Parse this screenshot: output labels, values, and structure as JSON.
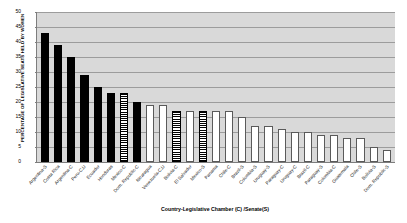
{
  "chart_data": {
    "type": "bar",
    "title": "",
    "xlabel": "Country-Legislative Chamber (C) /Senate(S)",
    "ylabel": "PERCENTAGE OF LEGISLATIVE SEATS HELD BY WOMEN",
    "ylim": [
      0,
      50
    ],
    "ytick_step": 5,
    "yticks": [
      "50",
      "45",
      "40",
      "35",
      "30",
      "25",
      "20",
      "15",
      "10",
      "5",
      "0"
    ],
    "grid": true,
    "legend": "none",
    "plot_background": "#d9d9d9",
    "categories": [
      "Argentina-S",
      "Costa Rica",
      "Argentina-C",
      "Peru-C,U",
      "Ecuador",
      "Honduras",
      "Mexico-C",
      "Dom. Republic-C",
      "Nicaragua",
      "Venezuela-C,U",
      "Bolivia-C",
      "El Salvador",
      "Mexico-S",
      "Panama",
      "Chile-C",
      "Brazil-S",
      "Colombia-S",
      "Uruguay-S",
      "Paraguay-C",
      "Uruguay-C",
      "Brazil-C",
      "Paraguay-S",
      "Colombia-C",
      "Guatemala",
      "Chile-S",
      "Bolivia-S",
      "Dom. Republic-S"
    ],
    "values": [
      43,
      39,
      35,
      29,
      25,
      23,
      23,
      20,
      19,
      19,
      17,
      17,
      17,
      17,
      17,
      15,
      12,
      12,
      11,
      10,
      10,
      9,
      9,
      8,
      8,
      5,
      4
    ],
    "bar_styles": [
      "solid",
      "solid",
      "solid",
      "solid",
      "solid",
      "solid",
      "striped",
      "solid",
      "open",
      "open",
      "striped",
      "open",
      "striped",
      "open",
      "open",
      "open",
      "open",
      "open",
      "open",
      "open",
      "open",
      "open",
      "open",
      "open",
      "open",
      "open",
      "open"
    ],
    "colors": {
      "solid": "#000000",
      "open": "#ffffff",
      "striped_fg": "#000000",
      "striped_bg": "#ffffff",
      "plot_bg": "#d9d9d9",
      "gridline": "#9c9c9c",
      "axis": "#7d7d7d"
    }
  }
}
